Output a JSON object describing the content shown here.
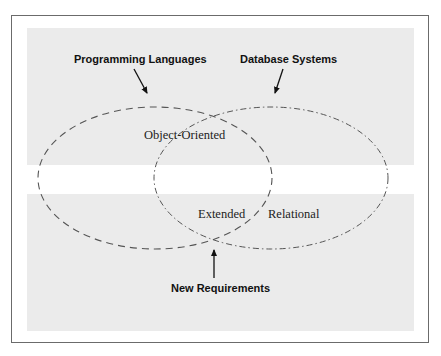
{
  "diagram": {
    "type": "venn",
    "sets": [
      {
        "name": "Programming Languages",
        "style": "dashed"
      },
      {
        "name": "Database Systems",
        "style": "dash-dot"
      }
    ],
    "labels": {
      "programming_languages": "Programming Languages",
      "database_systems": "Database Systems",
      "object_oriented": "Object-Oriented",
      "extended": "Extended",
      "relational": "Relational",
      "new_requirements": "New Requirements"
    },
    "colors": {
      "band": "#ebebeb",
      "frame": "#6b6b6b",
      "stroke": "#555555",
      "text": "#111111"
    }
  }
}
